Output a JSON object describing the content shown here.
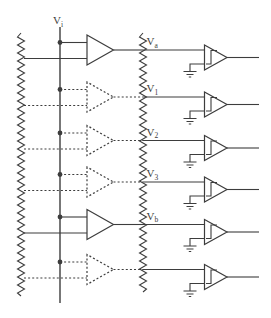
{
  "figure": {
    "input_label": {
      "base": "V",
      "sub": "i"
    },
    "rows": [
      {
        "label_base": "V",
        "label_sub": "a",
        "amp_style": "solid"
      },
      {
        "label_base": "V",
        "label_sub": "1",
        "amp_style": "dashed"
      },
      {
        "label_base": "V",
        "label_sub": "2",
        "amp_style": "dashed"
      },
      {
        "label_base": "V",
        "label_sub": "3",
        "amp_style": "dashed"
      },
      {
        "label_base": "V",
        "label_sub": "b",
        "amp_style": "solid"
      },
      {
        "label_base": "",
        "label_sub": "",
        "amp_style": "dashed"
      }
    ]
  },
  "colors": {
    "line": "#3d3d3d",
    "background": "#ffffff"
  }
}
